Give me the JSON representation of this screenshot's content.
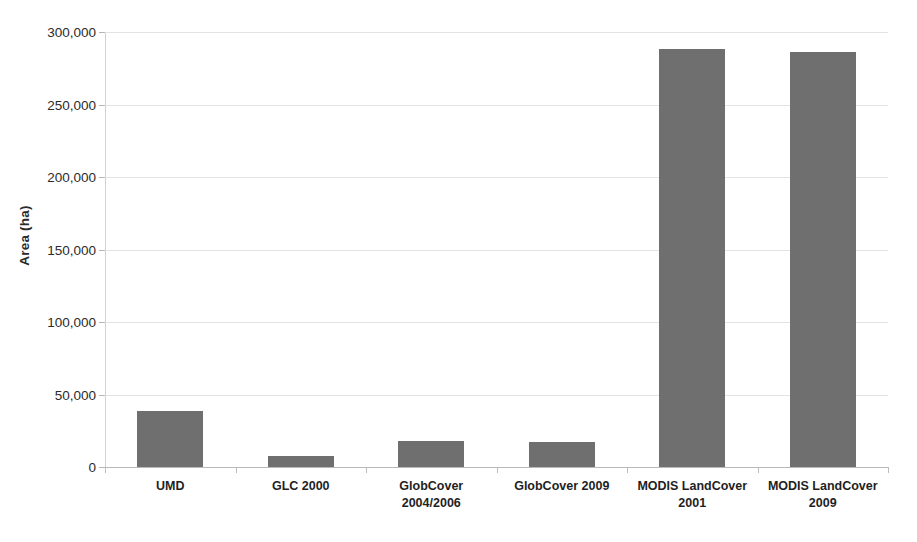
{
  "chart_data": {
    "type": "bar",
    "title": "",
    "xlabel": "",
    "ylabel": "Area (ha)",
    "ylim": [
      0,
      300000
    ],
    "ytick_labels": [
      "300,000",
      "250,000",
      "200,000",
      "150,000",
      "100,000",
      "50,000",
      "0"
    ],
    "ytick_values": [
      300000,
      250000,
      200000,
      150000,
      100000,
      50000,
      0
    ],
    "grid": true,
    "legend": false,
    "categories": [
      "UMD",
      "GLC 2000",
      "GlobCover\n2004/2006",
      "GlobCover 2009",
      "MODIS LandCover\n2001",
      "MODIS LandCover\n2009"
    ],
    "values": [
      39500,
      8300,
      18800,
      18000,
      289000,
      287000
    ],
    "bar_color": "#6f6f6f",
    "gridline_color": "#e3e3e3",
    "axis_color": "#b9b9b9",
    "background_color": "#ffffff"
  }
}
